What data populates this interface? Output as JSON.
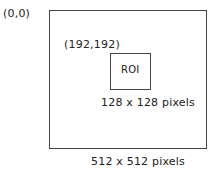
{
  "diagram": {
    "origin_label": "(0,0)",
    "outer_box": {
      "size_label": "512 x 512 pixels"
    },
    "roi": {
      "coord_label": "(192,192)",
      "label": "ROI",
      "size_label": "128 x 128 pixels"
    }
  }
}
